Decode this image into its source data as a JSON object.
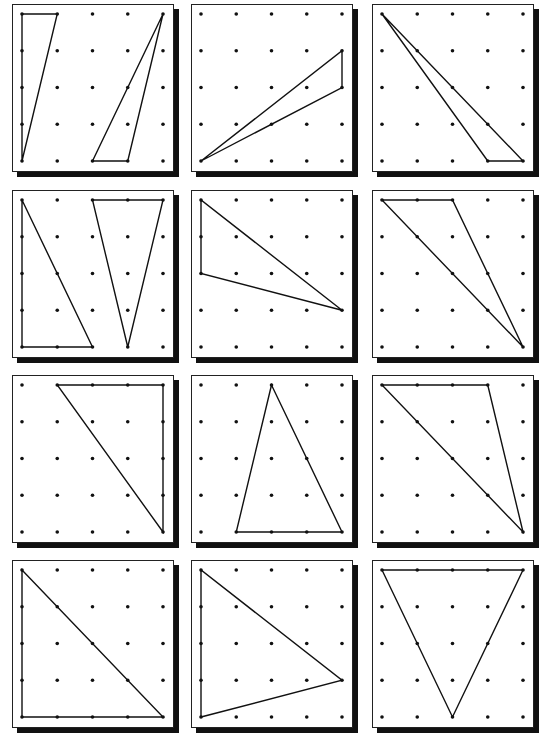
{
  "worksheet": {
    "grid": {
      "columns": 3,
      "rows": 4,
      "pegs_per_side": 5
    },
    "boards": [
      {
        "id": 1,
        "triangles": [
          [
            [
              0,
              0
            ],
            [
              1,
              0
            ],
            [
              0,
              4
            ]
          ],
          [
            [
              4,
              0
            ],
            [
              2,
              4
            ],
            [
              3,
              4
            ]
          ]
        ]
      },
      {
        "id": 2,
        "triangles": [
          [
            [
              0,
              4
            ],
            [
              4,
              1
            ],
            [
              4,
              2
            ]
          ]
        ]
      },
      {
        "id": 3,
        "triangles": [
          [
            [
              0,
              0
            ],
            [
              3,
              4
            ],
            [
              4,
              4
            ]
          ]
        ]
      },
      {
        "id": 4,
        "triangles": [
          [
            [
              0,
              0
            ],
            [
              0,
              4
            ],
            [
              2,
              4
            ]
          ],
          [
            [
              2,
              0
            ],
            [
              4,
              0
            ],
            [
              3,
              4
            ]
          ]
        ]
      },
      {
        "id": 5,
        "triangles": [
          [
            [
              0,
              0
            ],
            [
              0,
              2
            ],
            [
              4,
              3
            ]
          ]
        ]
      },
      {
        "id": 6,
        "triangles": [
          [
            [
              0,
              0
            ],
            [
              2,
              0
            ],
            [
              4,
              4
            ]
          ]
        ]
      },
      {
        "id": 7,
        "triangles": [
          [
            [
              1,
              0
            ],
            [
              4,
              0
            ],
            [
              4,
              4
            ]
          ]
        ]
      },
      {
        "id": 8,
        "triangles": [
          [
            [
              2,
              0
            ],
            [
              1,
              4
            ],
            [
              4,
              4
            ]
          ]
        ]
      },
      {
        "id": 9,
        "triangles": [
          [
            [
              0,
              0
            ],
            [
              3,
              0
            ],
            [
              4,
              4
            ]
          ]
        ]
      },
      {
        "id": 10,
        "triangles": [
          [
            [
              0,
              0
            ],
            [
              0,
              4
            ],
            [
              4,
              4
            ]
          ]
        ]
      },
      {
        "id": 11,
        "triangles": [
          [
            [
              0,
              0
            ],
            [
              0,
              4
            ],
            [
              4,
              3
            ]
          ]
        ]
      },
      {
        "id": 12,
        "triangles": [
          [
            [
              0,
              0
            ],
            [
              4,
              0
            ],
            [
              2,
              4
            ]
          ]
        ]
      }
    ]
  },
  "colors": {
    "line": "#111111",
    "background": "#ffffff",
    "shadow": "#111111"
  }
}
